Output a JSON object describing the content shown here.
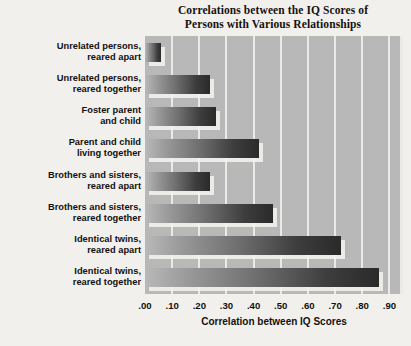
{
  "chart_data": {
    "type": "bar",
    "orientation": "horizontal",
    "title": "Correlations between the IQ Scores of Persons with Various Relationships",
    "title_lines": [
      "Correlations between the IQ Scores of",
      "Persons with Various Relationships"
    ],
    "xlabel": "Correlation between IQ Scores",
    "ylabel": "",
    "xlim": [
      0.0,
      0.95
    ],
    "xticks": [
      ".00",
      ".10",
      ".20",
      ".30",
      ".40",
      ".50",
      ".60",
      ".70",
      ".80",
      ".90"
    ],
    "xtick_values": [
      0.0,
      0.1,
      0.2,
      0.3,
      0.4,
      0.5,
      0.6,
      0.7,
      0.8,
      0.9
    ],
    "grid": true,
    "grid_axis": "x",
    "legend": null,
    "categories": [
      "Unrelated persons, reared apart",
      "Unrelated persons, reared together",
      "Foster parent and child",
      "Parent and child living together",
      "Brothers and sisters, reared apart",
      "Brothers and sisters, reared together",
      "Identical twins, reared apart",
      "Identical twins, reared together"
    ],
    "category_lines": [
      [
        "Unrelated persons,",
        "reared apart"
      ],
      [
        "Unrelated persons,",
        "reared together"
      ],
      [
        "Foster parent",
        "and child"
      ],
      [
        "Parent and child",
        "living together"
      ],
      [
        "Brothers and sisters,",
        "reared apart"
      ],
      [
        "Brothers and sisters,",
        "reared together"
      ],
      [
        "Identical twins,",
        "reared apart"
      ],
      [
        "Identical twins,",
        "reared together"
      ]
    ],
    "values": [
      0.06,
      0.24,
      0.26,
      0.42,
      0.24,
      0.47,
      0.72,
      0.86
    ]
  },
  "colors": {
    "page_background": "#f2f0ec",
    "plot_background": "#b8b8b8",
    "gridline": "#eceae6",
    "bar_gradient_start": "#b9b9b9",
    "bar_gradient_end": "#2a2a2a",
    "text": "#111111",
    "title_text": "#15120f"
  }
}
